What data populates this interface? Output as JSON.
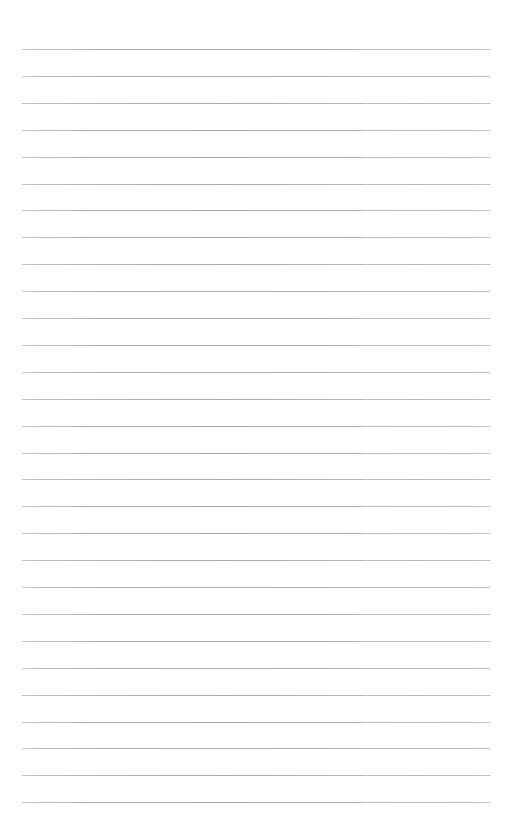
{
  "page": {
    "kind": "ruled-notebook-page",
    "width": 514,
    "height": 840,
    "background_color": "#ffffff",
    "content_text": "",
    "has_text_content": false,
    "has_images": false
  },
  "rules": {
    "count": 29,
    "first_line_y": 49,
    "last_line_y": 802,
    "spacing_px": 26.9,
    "thickness_px": 1,
    "left_x": 22,
    "right_x": 490,
    "line_color": "#b9b9bd",
    "line_color_dark": "#a9a9ae",
    "line_color_light": "#c4c4c8",
    "seam_x": 365
  },
  "margins": {
    "top_px": 49,
    "bottom_px": 38,
    "left_px": 22,
    "right_px": 24
  }
}
